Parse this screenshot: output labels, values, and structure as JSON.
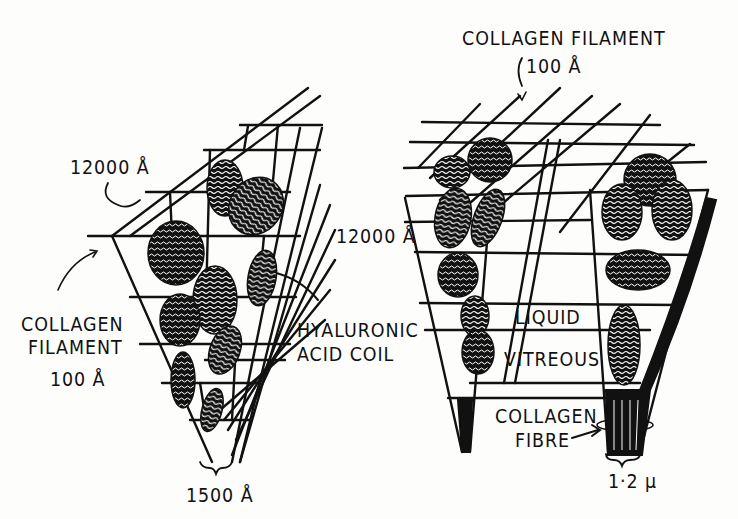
{
  "figure": {
    "left_panel": {
      "labels": {
        "top_dimension": "12000 Å",
        "collagen_filament_line1": "COLLAGEN",
        "collagen_filament_line2": "FILAMENT",
        "collagen_filament_size": "100 Å",
        "hyaluronic_line1": "HYALURONIC",
        "hyaluronic_line2": "ACID COIL",
        "bottom_dimension": "1500 Å"
      }
    },
    "right_panel": {
      "labels": {
        "collagen_filament_title": "COLLAGEN FILAMENT",
        "collagen_filament_size": "100 Å",
        "side_dimension": "12000 Å",
        "liquid": "LIQUID",
        "vitreous": "VITREOUS",
        "collagen_fibre_line1": "COLLAGEN",
        "collagen_fibre_line2": "FIBRE",
        "fibre_width": "1·2 μ"
      }
    },
    "colors": {
      "ink": "#111111",
      "paper": "#fdfdfc"
    }
  }
}
